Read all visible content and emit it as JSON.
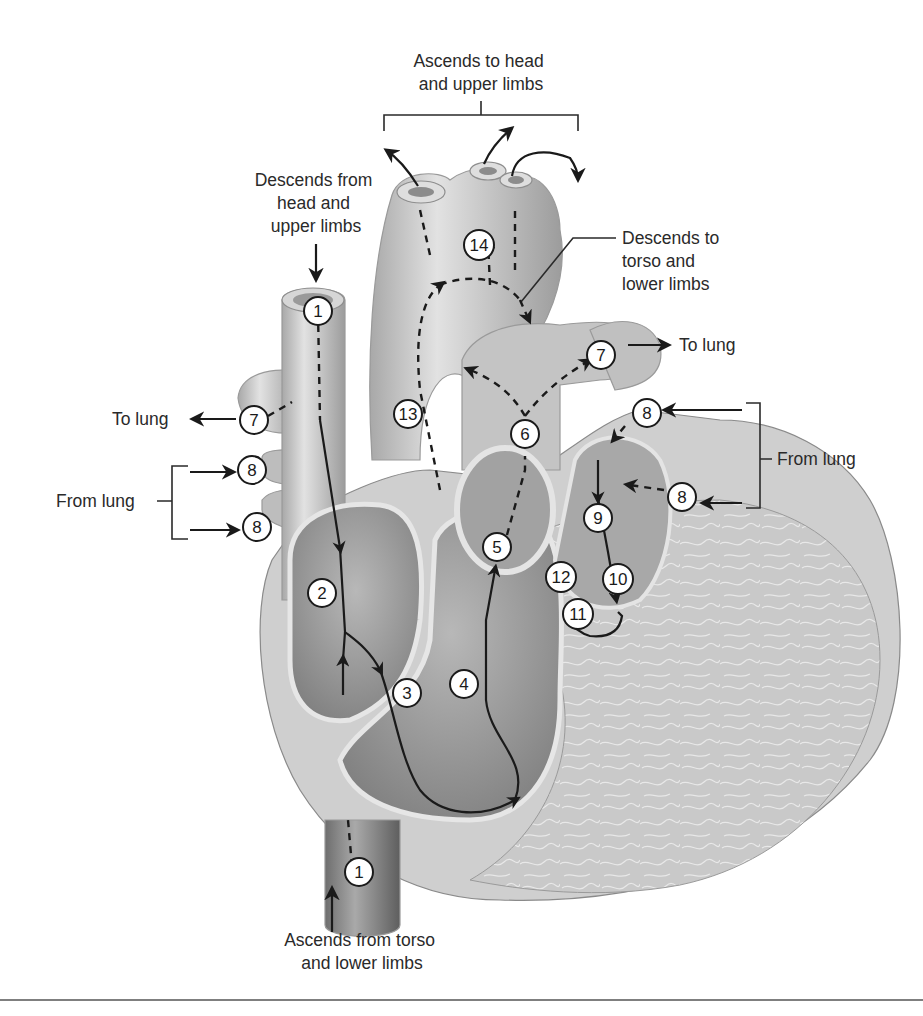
{
  "figure": {
    "type": "heart-blood-flow-diagram",
    "labels": {
      "ascends_to_head": [
        "Ascends to head",
        "and upper limbs"
      ],
      "descends_from_head": [
        "Descends from",
        "head and",
        "upper limbs"
      ],
      "descends_to_torso": [
        "Descends to",
        "torso and",
        "lower limbs"
      ],
      "to_lung_right": "To lung",
      "to_lung_left": "To lung",
      "from_lung_right": "From lung",
      "from_lung_left": "From lung",
      "ascends_from_torso": [
        "Ascends from torso",
        "and lower limbs"
      ]
    },
    "markers": [
      {
        "id": "m1-top",
        "label": "1"
      },
      {
        "id": "m1-bottom",
        "label": "1"
      },
      {
        "id": "m2",
        "label": "2"
      },
      {
        "id": "m3",
        "label": "3"
      },
      {
        "id": "m4",
        "label": "4"
      },
      {
        "id": "m5",
        "label": "5"
      },
      {
        "id": "m6",
        "label": "6"
      },
      {
        "id": "m7-left",
        "label": "7"
      },
      {
        "id": "m7-right",
        "label": "7"
      },
      {
        "id": "m8-left-top",
        "label": "8"
      },
      {
        "id": "m8-left-bottom",
        "label": "8"
      },
      {
        "id": "m8-right-top",
        "label": "8"
      },
      {
        "id": "m8-right-bottom",
        "label": "8"
      },
      {
        "id": "m9",
        "label": "9"
      },
      {
        "id": "m10",
        "label": "10"
      },
      {
        "id": "m11",
        "label": "11"
      },
      {
        "id": "m12",
        "label": "12"
      },
      {
        "id": "m13",
        "label": "13"
      },
      {
        "id": "m14",
        "label": "14"
      }
    ]
  }
}
